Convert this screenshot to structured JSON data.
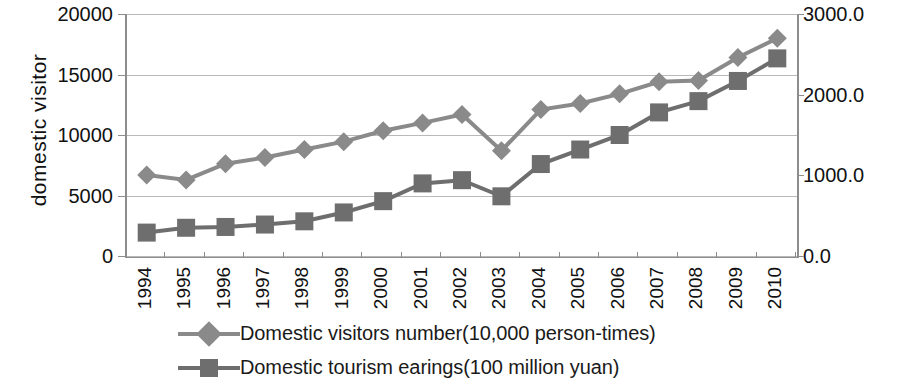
{
  "chart_data": {
    "type": "line",
    "title": "",
    "xlabel": "",
    "ylabel": "domestic  visitor",
    "y2label": "",
    "grid": true,
    "legend_position": "bottom",
    "ylim": [
      0,
      20000
    ],
    "y2lim": [
      0.0,
      3000.0
    ],
    "y_ticks": [
      "0",
      "5000",
      "10000",
      "15000",
      "20000"
    ],
    "y_tick_values": [
      0,
      5000,
      10000,
      15000,
      20000
    ],
    "y2_ticks": [
      "0.0",
      "1000.0",
      "2000.0",
      "3000.0"
    ],
    "y2_tick_values": [
      0,
      1000,
      2000,
      3000
    ],
    "categories": [
      "1994",
      "1995",
      "1996",
      "1997",
      "1998",
      "1999",
      "2000",
      "2001",
      "2002",
      "2003",
      "2004",
      "2005",
      "2006",
      "2007",
      "2008",
      "2009",
      "2010"
    ],
    "series": [
      {
        "name": "Domestic visitors number(10,000 person-times)",
        "axis": "left",
        "marker": "diamond",
        "color": "#8a8a8a",
        "values": [
          6700,
          6290,
          7630,
          8140,
          8800,
          9450,
          10350,
          11000,
          11700,
          8700,
          12100,
          12600,
          13400,
          14400,
          14500,
          16400,
          18000
        ]
      },
      {
        "name": "Domestic tourism earings(100 million yuan)",
        "axis": "right",
        "marker": "square",
        "color": "#6e6e6e",
        "values": [
          290,
          350,
          360,
          390,
          430,
          540,
          680,
          900,
          940,
          740,
          1140,
          1320,
          1500,
          1780,
          1920,
          2170,
          2450
        ]
      }
    ]
  },
  "legend": {
    "items": [
      {
        "label": "Domestic visitors number(10,000 person-times)",
        "marker": "diamond-marker",
        "color": "#8a8a8a"
      },
      {
        "label": "Domestic tourism earings(100 million yuan)",
        "marker": "square-marker",
        "color": "#6e6e6e"
      }
    ]
  }
}
